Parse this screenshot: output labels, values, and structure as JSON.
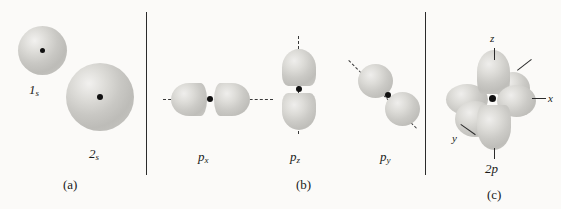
{
  "figure": {
    "background_color": "#fbfaf8",
    "ink_color": "#1a1a1a",
    "lobe_color": "#c9c8c4"
  },
  "panels": [
    {
      "id": "a",
      "caption": "(a)",
      "orbitals": [
        {
          "name": "1s-orbital",
          "label_base": "1",
          "label_sub": "s",
          "shape": "sphere"
        },
        {
          "name": "2s-orbital",
          "label_base": "2",
          "label_sub": "s",
          "shape": "sphere"
        }
      ]
    },
    {
      "id": "b",
      "caption": "(b)",
      "orbitals": [
        {
          "name": "px-orbital",
          "label_base": "p",
          "label_sub": "x",
          "shape": "dumbbell-horizontal"
        },
        {
          "name": "pz-orbital",
          "label_base": "p",
          "label_sub": "z",
          "shape": "dumbbell-vertical"
        },
        {
          "name": "py-orbital",
          "label_base": "p",
          "label_sub": "y",
          "shape": "dumbbell-diagonal"
        }
      ]
    },
    {
      "id": "c",
      "caption": "(c)",
      "orbitals": [
        {
          "name": "2p-orbital-set",
          "label_base": "2",
          "label_sub": "p",
          "shape": "six-lobe"
        }
      ],
      "axes": [
        {
          "name": "axis-z",
          "label": "z"
        },
        {
          "name": "axis-x",
          "label": "x"
        },
        {
          "name": "axis-y",
          "label": "y"
        }
      ]
    }
  ]
}
